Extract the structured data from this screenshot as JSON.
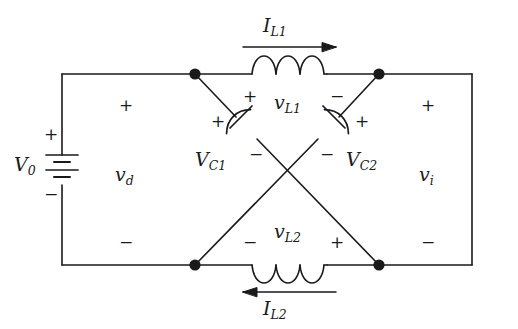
{
  "figure": {
    "kind": "circuit-schematic",
    "background_color": "#ffffff",
    "line_color": "#1a1a1a"
  },
  "source": {
    "name": "voltage-source",
    "symbol": "battery",
    "label_main": "V",
    "label_sub": "0",
    "plus": "+",
    "minus": "−"
  },
  "left_port": {
    "label_main": "v",
    "label_sub": "d",
    "plus": "+",
    "minus": "−"
  },
  "right_port": {
    "label_main": "v",
    "label_sub": "i",
    "plus": "+",
    "minus": "−"
  },
  "inductor_top": {
    "name": "L1",
    "voltage_main": "v",
    "voltage_sub": "L1",
    "current_main": "I",
    "current_sub": "L1",
    "current_direction": "right",
    "plus": "+",
    "minus": "−"
  },
  "inductor_bottom": {
    "name": "L2",
    "voltage_main": "v",
    "voltage_sub": "L2",
    "current_main": "I",
    "current_sub": "L2",
    "current_direction": "left",
    "plus": "+",
    "minus": "−"
  },
  "capacitor_left": {
    "name": "C1",
    "label_main": "V",
    "label_sub": "C1",
    "plus": "+",
    "minus": "−"
  },
  "capacitor_right": {
    "name": "C2",
    "label_main": "V",
    "label_sub": "C2",
    "plus": "+",
    "minus": "−"
  }
}
